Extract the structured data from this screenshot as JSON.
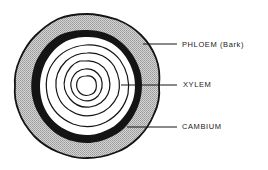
{
  "diagram": {
    "labels": [
      {
        "id": "phloem",
        "text": "PHLOEM (Bark)"
      },
      {
        "id": "xylem",
        "text": "XYLEM"
      },
      {
        "id": "cambium",
        "text": "CAMBIUM"
      }
    ],
    "colors": {
      "background": "#ffffff",
      "outline": "#141414",
      "bark_fill": "#bdbdbd",
      "cambium_band": "#141414",
      "xylem_fill": "#ffffff"
    },
    "geometry": {
      "center": [
        87,
        86
      ],
      "outer_radius": 72,
      "cambium_outer_radius": 56,
      "cambium_inner_radius": 48,
      "growth_ring_radii": [
        44,
        36,
        28,
        20,
        11
      ]
    }
  }
}
